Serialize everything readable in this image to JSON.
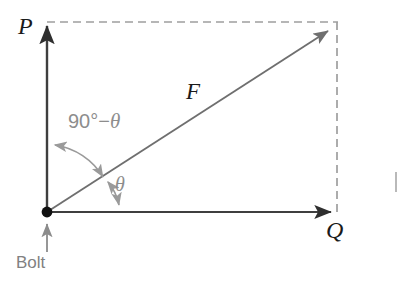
{
  "diagram": {
    "type": "vector-force-diagram",
    "labels": {
      "p_axis": "P",
      "q_axis": "Q",
      "resultant": "F",
      "anchor": "Bolt",
      "angle_theta": "θ",
      "angle_complement_prefix": "90°−",
      "angle_complement_symbol": "θ",
      "angle_complement_full": "90°−θ"
    },
    "colors": {
      "axis": "#3f3f3f",
      "resultant": "#6f6f6f",
      "dashed": "#9e9e9e",
      "arc": "#9a9a9a",
      "anchor_dot": "#111111",
      "bolt_arrow": "#8c8c8c",
      "label_dark": "#1a1a1a",
      "label_gray": "#818181",
      "background": "#ffffff"
    },
    "geometry": {
      "origin": [
        47,
        212
      ],
      "p_axis_tip": [
        47,
        22
      ],
      "q_axis_tip": [
        337,
        212
      ],
      "resultant_tip": [
        333,
        27
      ],
      "dashed_top_from": [
        47,
        22
      ],
      "dashed_top_to": [
        337,
        22
      ],
      "dashed_right_from": [
        337,
        22
      ],
      "dashed_right_to": [
        337,
        212
      ],
      "bolt_arrow_from": [
        47,
        252
      ],
      "bolt_arrow_to": [
        47,
        222
      ],
      "theta_arc_radius": 80,
      "complement_arc_radius": 68
    }
  }
}
